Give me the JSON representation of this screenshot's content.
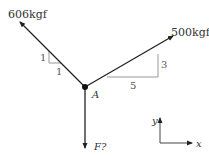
{
  "diagram": {
    "type": "free-body-diagram",
    "point": {
      "label": "A"
    },
    "forces": [
      {
        "id": "left",
        "label": "606kgf",
        "slope": {
          "rise": "1",
          "run": "1"
        }
      },
      {
        "id": "right",
        "label": "500kgf",
        "slope": {
          "rise": "3",
          "run": "5"
        }
      },
      {
        "id": "down",
        "label": "F?"
      }
    ],
    "axes": {
      "x_label": "x",
      "y_label": "y"
    },
    "colors": {
      "line": "#222222",
      "triangle": "#999999",
      "text": "#333333"
    }
  }
}
